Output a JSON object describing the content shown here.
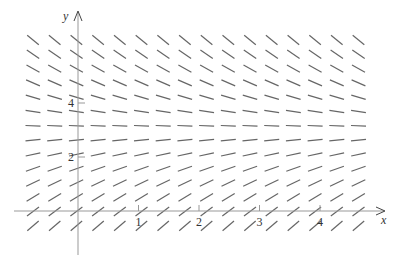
{
  "chart_data": {
    "type": "direction_field",
    "title": "",
    "equation": "dy/dx = k(3 - y) (equilibrium at y = 3)",
    "equilibrium_y": 3,
    "xlabel": "x",
    "ylabel": "y",
    "x_ticks": [
      "1",
      "2",
      "3",
      "4"
    ],
    "y_ticks": [
      "2",
      "4"
    ],
    "xlim": [
      -0.75,
      4.8
    ],
    "ylim": [
      -0.6,
      6.4
    ],
    "grid": false,
    "field": {
      "cols": 16,
      "rows": 14,
      "x0_px": 33,
      "dx_px": 21.7,
      "y0_px": 40,
      "dy_px": 14.3,
      "segment_len_px": 15,
      "origin_px": [
        78,
        211
      ],
      "unit_x_px": 60.5,
      "unit_y_px": 27,
      "slope_scale": 0.55
    },
    "colors": {
      "segment": "#666666",
      "axis": "#999999"
    }
  }
}
